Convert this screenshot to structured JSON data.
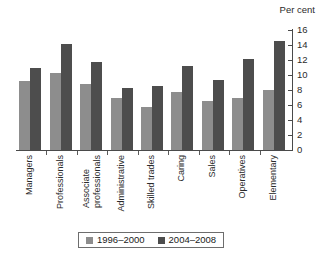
{
  "chart_data": {
    "type": "bar",
    "title": "",
    "subtitle": "",
    "xlabel": "",
    "ylabel": "Per cent",
    "ylim": [
      0,
      16
    ],
    "ytick_step": 2,
    "yticks": [
      "0",
      "2",
      "4",
      "6",
      "8",
      "10",
      "12",
      "14",
      "16"
    ],
    "grid": false,
    "legend_position": "bottom",
    "categories": [
      "Managers",
      "Associate professionals",
      "Professionals",
      "Administrative",
      "Skilled trades",
      "Caring",
      "Sales",
      "Operatives",
      "Elementary"
    ],
    "category_labels": [
      {
        "line1": "Managers",
        "line2": ""
      },
      {
        "line1": "Professionals",
        "line2": ""
      },
      {
        "line1": "Associate",
        "line2": "professionals"
      },
      {
        "line1": "Administrative",
        "line2": ""
      },
      {
        "line1": "Skilled trades",
        "line2": ""
      },
      {
        "line1": "Caring",
        "line2": ""
      },
      {
        "line1": "Sales",
        "line2": ""
      },
      {
        "line1": "Operatives",
        "line2": ""
      },
      {
        "line1": "Elementary",
        "line2": ""
      }
    ],
    "series": [
      {
        "name": "1996–2000",
        "color": "#8d8d8d",
        "values": [
          9.2,
          10.3,
          8.8,
          7.0,
          5.7,
          7.8,
          6.5,
          6.9,
          8.0
        ]
      },
      {
        "name": "2004–2008",
        "color": "#4d4d4d",
        "values": [
          11.0,
          14.2,
          11.8,
          8.3,
          8.5,
          11.2,
          9.3,
          12.2,
          14.5
        ]
      }
    ]
  },
  "colors": {
    "series_1996_2000": "#8d8d8d",
    "series_2004_2008": "#4d4d4d",
    "axis": "#4a4a4a",
    "text": "#1a1a1a",
    "background": "#ffffff"
  }
}
